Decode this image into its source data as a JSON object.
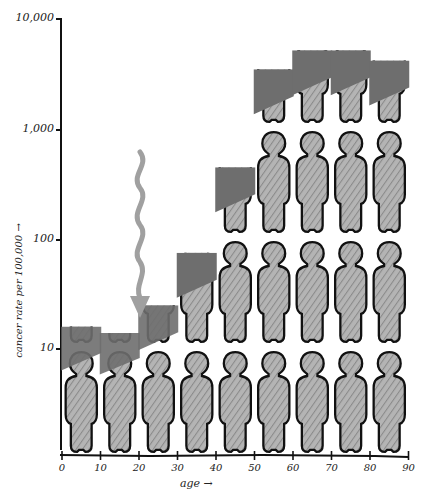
{
  "chart_data": {
    "type": "bar",
    "title": "",
    "xlabel": "age",
    "ylabel": "cancer rate per 100,000",
    "yscale": "log",
    "ylim": [
      1,
      10000
    ],
    "xlim": [
      0,
      90
    ],
    "yticks": [
      "10",
      "100",
      "1,000",
      "10,000"
    ],
    "xticks": [
      "0",
      "10",
      "20",
      "30",
      "40",
      "50",
      "60",
      "70",
      "80",
      "90"
    ],
    "categories": [
      "0-10",
      "10-20",
      "20-30",
      "30-40",
      "40-50",
      "50-60",
      "60-70",
      "70-80",
      "80-90"
    ],
    "values": [
      16,
      14,
      25,
      75,
      450,
      3500,
      5200,
      5200,
      4200
    ],
    "grid": false,
    "legend": null,
    "style": "hand-drawn isotype; stacked human figures, one figure per decade of the log scale; solid dark fill marks the top portion of each column",
    "annotations": [
      {
        "type": "wavy-arrow",
        "description": "wavy grey arrow pointing down to the 20-30 age column",
        "x": 20,
        "y_from": 700,
        "y_to": 25
      }
    ],
    "colors": {
      "figure_fill": "#a8a8a8",
      "figure_dark": "#6e6e6e",
      "outline": "#111111",
      "arrow": "#a0a0a0"
    }
  },
  "axis": {
    "y_labels": [
      "10",
      "100",
      "1,000",
      "10,000"
    ],
    "x_labels": [
      "0",
      "10",
      "20",
      "30",
      "40",
      "50",
      "60",
      "70",
      "80",
      "90"
    ],
    "x_title": "age →",
    "y_title": "cancer rate per 100,000 →"
  }
}
